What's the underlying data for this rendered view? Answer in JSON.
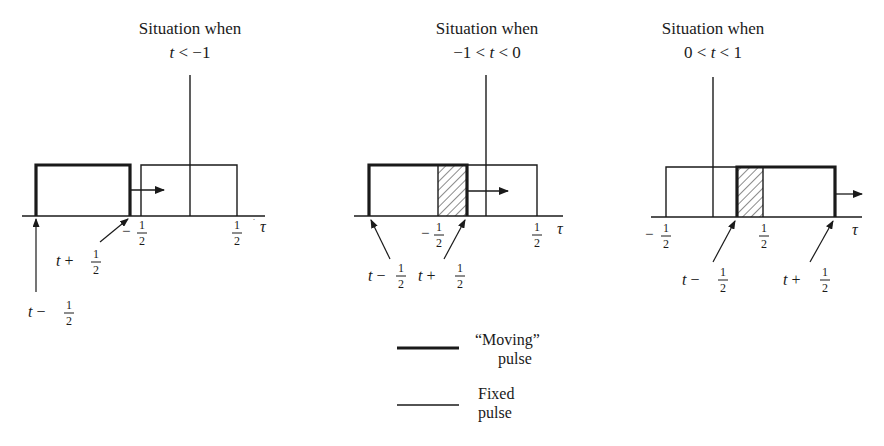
{
  "panels": [
    {
      "title_line1": "Situation when",
      "title_line2": "t < −1",
      "axis_label": "τ",
      "tick_left": "−½",
      "tick_right": "½",
      "label_left_edge": "t − ½",
      "label_right_edge": "t + ½",
      "moving_pulse": {
        "from": "t − 1/2",
        "to": "t + 1/2"
      },
      "fixed_pulse": {
        "from": "-1/2",
        "to": "1/2"
      },
      "overlap": "none"
    },
    {
      "title_line1": "Situation when",
      "title_line2": "−1 < t < 0",
      "axis_label": "τ",
      "tick_left": "−½",
      "tick_right": "½",
      "label_left_edge": "t − ½",
      "label_right_edge": "t + ½",
      "moving_pulse": {
        "from": "t − 1/2",
        "to": "t + 1/2"
      },
      "fixed_pulse": {
        "from": "-1/2",
        "to": "1/2"
      },
      "overlap": "-1/2 to t + 1/2 (hatched)"
    },
    {
      "title_line1": "Situation when",
      "title_line2": "0 < t < 1",
      "axis_label": "τ",
      "tick_left": "−½",
      "tick_right": "½",
      "label_left_edge": "t − ½",
      "label_right_edge": "t + ½",
      "moving_pulse": {
        "from": "t − 1/2",
        "to": "t + 1/2"
      },
      "fixed_pulse": {
        "from": "-1/2",
        "to": "1/2"
      },
      "overlap": "t − 1/2 to 1/2 (hatched)"
    }
  ],
  "legend": {
    "moving_line1": "“Moving”",
    "moving_line2": "pulse",
    "fixed_line1": "Fixed",
    "fixed_line2": "pulse"
  },
  "colors": {
    "ink": "#1a1a1a",
    "background": "#ffffff"
  }
}
